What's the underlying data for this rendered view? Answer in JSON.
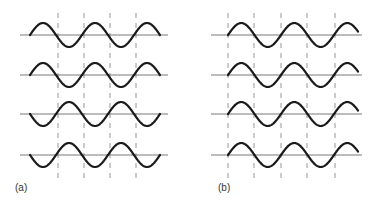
{
  "figure": {
    "colors": {
      "wave": "#1a1a1a",
      "baseline": "#7a7a7a",
      "dash": "#8a8a8a",
      "label": "#333333"
    },
    "panels": [
      {
        "id": "a",
        "label": "(a)",
        "baseline_x": [
          20,
          168
        ],
        "wave_x": [
          30,
          160
        ],
        "half_period": 26,
        "amplitude": 12,
        "dashes_x": [
          58,
          84,
          110,
          136
        ],
        "dash_y": [
          13,
          178
        ],
        "rows": [
          {
            "baseline_y": 35,
            "phase": "up"
          },
          {
            "baseline_y": 75,
            "phase": "up"
          },
          {
            "baseline_y": 114,
            "phase": "down"
          },
          {
            "baseline_y": 155,
            "phase": "down"
          }
        ]
      },
      {
        "id": "b",
        "label": "(b)",
        "baseline_x": [
          211,
          362
        ],
        "wave_x": [
          228,
          358
        ],
        "half_period": 26.5,
        "amplitude": 12,
        "dashes_x": [
          228,
          254,
          281,
          307,
          335
        ],
        "dash_y": [
          13,
          178
        ],
        "rows": [
          {
            "baseline_y": 35,
            "phase": "up"
          },
          {
            "baseline_y": 75,
            "phase": "up"
          },
          {
            "baseline_y": 114,
            "phase": "up"
          },
          {
            "baseline_y": 155,
            "phase": "up"
          }
        ]
      }
    ]
  }
}
